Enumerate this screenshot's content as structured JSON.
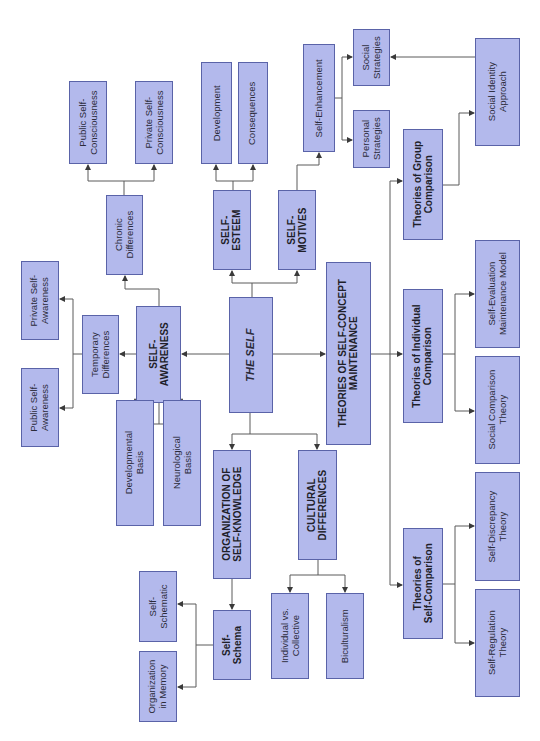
{
  "diagram": {
    "orientation": "rotated 90 degrees counter-clockwise",
    "colors": {
      "box_fill": "#b3b9ec",
      "box_border": "#5a63a8",
      "text": "#2b2b3a",
      "line": "#555555"
    },
    "nodes": {
      "the_self": "THE SELF",
      "self_awareness": "SELF-\nAWARENESS",
      "temporary_differences": "Temporary\nDifferences",
      "private_self_awareness": "Private Self-\nAwareness",
      "public_self_awareness": "Public Self-\nAwareness",
      "chronic_differences": "Chronic\nDifferences",
      "public_self_consciousness": "Public Self-\nConsciousness",
      "private_self_consciousness": "Private Self-\nConsciousness",
      "developmental_basis": "Developmental\nBasis",
      "neurological_basis": "Neurological\nBasis",
      "self_esteem": "SELF-\nESTEEM",
      "development": "Development",
      "consequences": "Consequences",
      "self_motives": "SELF-\nMOTIVES",
      "self_enhancement": "Self-Enhancement",
      "social_strategies": "Social\nStrategies",
      "personal_strategies": "Personal\nStrategies",
      "organization_self_knowledge": "ORGANIZATION OF\nSELF-KNOWLEDGE",
      "self_schema": "Self-\nSchema",
      "self_schematic": "Self-\nSchematic",
      "organization_in_memory": "Organization\nin Memory",
      "cultural_differences": "CULTURAL\nDIFFERENCES",
      "individual_vs_collective": "Individual vs.\nCollective",
      "biculturalism": "Biculturalism",
      "theories_maintenance": "THEORIES OF SELF-CONCEPT\nMAINTENANCE",
      "theories_group_comparison": "Theories of Group\nComparison",
      "social_identity_approach": "Social Identity\nApproach",
      "theories_individual_comparison": "Theories of Individual\nComparison",
      "self_evaluation_maintenance": "Self-Evaluation\nMaintenance Model",
      "social_comparison_theory": "Social Comparison\nTheory",
      "theories_self_comparison": "Theories of\nSelf-Comparison",
      "self_discrepancy_theory": "Self-Discrepancy\nTheory",
      "self_regulation_theory": "Self-Regulation\nTheory"
    }
  }
}
